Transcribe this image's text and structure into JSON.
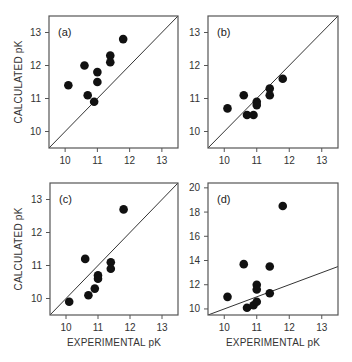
{
  "figure": {
    "ylabel": "CALCULATED pK",
    "xlabel": "EXPERIMENTAL pK"
  },
  "chart_data": [
    {
      "type": "scatter",
      "panel": "(a)",
      "xlabel": "",
      "ylabel": "CALCULATED pK",
      "xlim": [
        9.5,
        13.5
      ],
      "ylim": [
        9.5,
        13.5
      ],
      "xticks": [
        10,
        11,
        12,
        13
      ],
      "yticks": [
        10,
        11,
        12,
        13
      ],
      "reference_line": "y = x",
      "x": [
        10.1,
        10.6,
        10.7,
        10.9,
        11.0,
        11.0,
        11.4,
        11.4,
        11.8
      ],
      "y": [
        11.4,
        12.0,
        11.1,
        10.9,
        11.8,
        11.5,
        12.3,
        12.1,
        12.8
      ]
    },
    {
      "type": "scatter",
      "panel": "(b)",
      "xlabel": "",
      "ylabel": "",
      "xlim": [
        9.5,
        13.5
      ],
      "ylim": [
        9.5,
        13.5
      ],
      "xticks": [
        10,
        11,
        12,
        13
      ],
      "yticks": [
        10,
        11,
        12,
        13
      ],
      "reference_line": "y = x",
      "x": [
        10.1,
        10.6,
        10.7,
        10.9,
        11.0,
        11.0,
        11.4,
        11.4,
        11.8
      ],
      "y": [
        10.7,
        11.1,
        10.5,
        10.5,
        10.9,
        10.8,
        11.3,
        11.1,
        11.6
      ]
    },
    {
      "type": "scatter",
      "panel": "(c)",
      "xlabel": "EXPERIMENTAL pK",
      "ylabel": "CALCULATED pK",
      "xlim": [
        9.5,
        13.5
      ],
      "ylim": [
        9.5,
        13.5
      ],
      "xticks": [
        10,
        11,
        12,
        13
      ],
      "yticks": [
        10,
        11,
        12,
        13
      ],
      "reference_line": "y = x",
      "x": [
        10.1,
        10.6,
        10.7,
        10.9,
        11.0,
        11.0,
        11.4,
        11.4,
        11.8
      ],
      "y": [
        9.9,
        11.2,
        10.1,
        10.3,
        10.7,
        10.6,
        11.1,
        10.9,
        12.7
      ]
    },
    {
      "type": "scatter",
      "panel": "(d)",
      "xlabel": "EXPERIMENTAL pK",
      "ylabel": "",
      "xlim": [
        9.5,
        13.5
      ],
      "ylim": [
        9.5,
        20.4
      ],
      "xticks": [
        10,
        11,
        12,
        13
      ],
      "yticks": [
        10,
        12,
        14,
        16,
        18,
        20
      ],
      "reference_line": "y = x",
      "x": [
        10.1,
        10.6,
        10.7,
        10.9,
        11.0,
        11.0,
        11.0,
        11.4,
        11.4,
        11.8
      ],
      "y": [
        11.0,
        13.7,
        10.1,
        10.3,
        10.6,
        12.0,
        11.6,
        13.5,
        11.3,
        18.5
      ]
    }
  ],
  "panels_layout": [
    {
      "left": 49,
      "top": 16,
      "width": 129,
      "height": 132,
      "show_xlabel": false,
      "show_ylabel": true
    },
    {
      "left": 208,
      "top": 16,
      "width": 130,
      "height": 132,
      "show_xlabel": false,
      "show_ylabel": false
    },
    {
      "left": 50,
      "top": 183,
      "width": 128,
      "height": 132,
      "show_xlabel": true,
      "show_ylabel": true
    },
    {
      "left": 208,
      "top": 183,
      "width": 130,
      "height": 132,
      "show_xlabel": true,
      "show_ylabel": false
    }
  ],
  "colors": {
    "frame": "#555555",
    "marker": "#111111",
    "line": "#333333",
    "text": "#333333"
  }
}
